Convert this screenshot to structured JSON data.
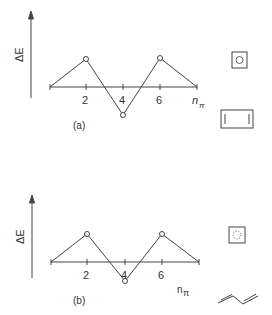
{
  "panel_a": {
    "label": "(a)",
    "y_axis_label": "ΔE",
    "x_axis_label": "n",
    "x_axis_subscript": "π",
    "ticks": [
      "2",
      "4",
      "6"
    ],
    "points": [
      {
        "n": 0,
        "dE": 0
      },
      {
        "n": 2,
        "dE": 1
      },
      {
        "n": 4,
        "dE": -1
      },
      {
        "n": 6,
        "dE": 1
      },
      {
        "n": 8,
        "dE": 0
      }
    ],
    "icons": [
      "square-with-inner-circle",
      "rectangle-with-double-bars"
    ]
  },
  "panel_b": {
    "label": "(b)",
    "y_axis_label": "ΔE",
    "x_axis_label": "n",
    "x_axis_subscript": "π",
    "ticks": [
      "2",
      "4",
      "6"
    ],
    "points": [
      {
        "n": 0,
        "dE": 0
      },
      {
        "n": 2,
        "dE": 1
      },
      {
        "n": 4,
        "dE": -0.8
      },
      {
        "n": 6,
        "dE": 1
      },
      {
        "n": 8,
        "dE": 0
      }
    ],
    "icons": [
      "square-with-dotted-circle",
      "butadiene-skeletal"
    ]
  }
}
